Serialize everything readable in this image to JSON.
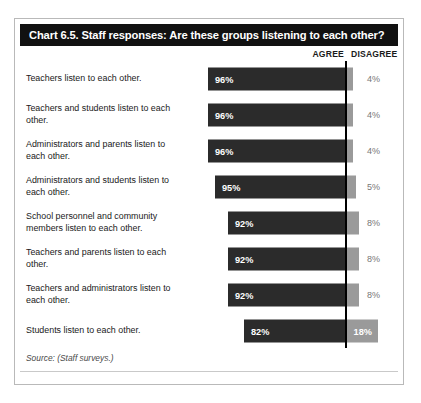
{
  "chart": {
    "title": "Chart 6.5. Staff responses: Are these groups listening to each other?",
    "source_note": "Source: (Staff surveys.)",
    "headers": {
      "agree": "AGREE",
      "disagree": "DISAGREE"
    }
  },
  "chart_data": {
    "type": "bar",
    "title": "Chart 6.5. Staff responses: Are these groups listening to each other?",
    "xlabel": "",
    "ylabel": "",
    "xlim": [
      0,
      100
    ],
    "grid": false,
    "legend_position": "top-right",
    "orientation": "horizontal",
    "stacked": true,
    "categories": [
      "Teachers listen to each other.",
      "Teachers and students listen to each other.",
      "Administrators and parents listen to each other.",
      "Administrators and students listen to each other.",
      "School personnel and community members listen to each other.",
      "Teachers and parents listen to each other.",
      "Teachers and administrators listen to each other.",
      "Students listen to each other."
    ],
    "series": [
      {
        "name": "AGREE",
        "color": "#2b2b2b",
        "values": [
          96,
          96,
          96,
          95,
          92,
          92,
          92,
          82
        ],
        "labels": [
          "96%",
          "96%",
          "96%",
          "95%",
          "92%",
          "92%",
          "92%",
          "82%"
        ]
      },
      {
        "name": "DISAGREE",
        "color": "#9a9a9a",
        "values": [
          4,
          4,
          4,
          5,
          8,
          8,
          8,
          18
        ],
        "labels": [
          "4%",
          "4%",
          "4%",
          "5%",
          "8%",
          "8%",
          "8%",
          "18%"
        ]
      }
    ]
  },
  "rows": [
    {
      "label": "Teachers listen to each other.",
      "agree": "96%",
      "disagree": "4%",
      "agree_w": 137,
      "disagree_w": 8,
      "inside": false
    },
    {
      "label": "Teachers and students listen to each other.",
      "agree": "96%",
      "disagree": "4%",
      "agree_w": 137,
      "disagree_w": 8,
      "inside": false
    },
    {
      "label": "Administrators and parents listen to each other.",
      "agree": "96%",
      "disagree": "4%",
      "agree_w": 137,
      "disagree_w": 8,
      "inside": false
    },
    {
      "label": "Administrators and students listen to each other.",
      "agree": "95%",
      "disagree": "5%",
      "agree_w": 130,
      "disagree_w": 11,
      "inside": false
    },
    {
      "label": "School personnel and community members listen to each other.",
      "agree": "92%",
      "disagree": "8%",
      "agree_w": 117,
      "disagree_w": 14,
      "inside": false
    },
    {
      "label": "Teachers and parents listen to each other.",
      "agree": "92%",
      "disagree": "8%",
      "agree_w": 117,
      "disagree_w": 14,
      "inside": false
    },
    {
      "label": "Teachers and administrators listen to each other.",
      "agree": "92%",
      "disagree": "8%",
      "agree_w": 117,
      "disagree_w": 14,
      "inside": false
    },
    {
      "label": "Students listen to each other.",
      "agree": "82%",
      "disagree": "18%",
      "agree_w": 101,
      "disagree_w": 33,
      "inside": true
    }
  ]
}
